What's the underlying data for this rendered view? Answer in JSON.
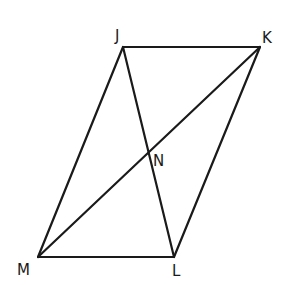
{
  "diagram": {
    "type": "geometry-figure",
    "points": [
      {
        "id": "J",
        "label": "J"
      },
      {
        "id": "K",
        "label": "K"
      },
      {
        "id": "L",
        "label": "L"
      },
      {
        "id": "M",
        "label": "M"
      },
      {
        "id": "N",
        "label": "N"
      }
    ],
    "segments": [
      {
        "id": "JK",
        "from": "J",
        "to": "K",
        "kind": "side"
      },
      {
        "id": "KL",
        "from": "K",
        "to": "L",
        "kind": "side"
      },
      {
        "id": "LM",
        "from": "L",
        "to": "M",
        "kind": "side"
      },
      {
        "id": "MJ",
        "from": "M",
        "to": "J",
        "kind": "side"
      },
      {
        "id": "JL",
        "from": "J",
        "to": "L",
        "kind": "diagonal"
      },
      {
        "id": "KM",
        "from": "K",
        "to": "M",
        "kind": "diagonal"
      }
    ],
    "colors": {
      "stroke": "#1a1a1a",
      "background": "#ffffff"
    }
  }
}
